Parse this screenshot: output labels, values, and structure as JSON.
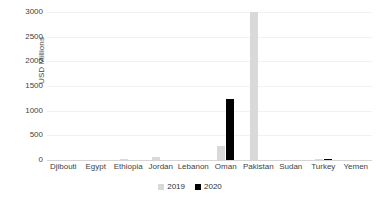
{
  "chart_data": {
    "type": "bar",
    "title": "",
    "xlabel": "",
    "ylabel": "USD Millions",
    "ylim": [
      0,
      3000
    ],
    "yticks": [
      0,
      500,
      1000,
      1500,
      2000,
      2500,
      3000
    ],
    "grid": true,
    "legend_position": "bottom",
    "categories": [
      "Djibouti",
      "Egypt",
      "Ethiopia",
      "Jordan",
      "Lebanon",
      "Oman",
      "Pakistan",
      "Sudan",
      "Turkey",
      "Yemen"
    ],
    "series": [
      {
        "name": "2019",
        "color": "#d9d9d9",
        "values": [
          0,
          0,
          25,
          55,
          0,
          285,
          3000,
          0,
          15,
          0
        ]
      },
      {
        "name": "2020",
        "color": "#000000",
        "values": [
          0,
          0,
          0,
          0,
          0,
          1235,
          0,
          0,
          10,
          0
        ]
      }
    ]
  },
  "axis": {
    "y_title": "USD Millions",
    "y_tick_labels": [
      "0",
      "500",
      "1000",
      "1500",
      "2000",
      "2500",
      "3000"
    ],
    "x_tick_labels": [
      "Djibouti",
      "Egypt",
      "Ethiopia",
      "Jordan",
      "Lebanon",
      "Oman",
      "Pakistan",
      "Sudan",
      "Turkey",
      "Yemen"
    ]
  },
  "legend": {
    "items": [
      {
        "label": "2019"
      },
      {
        "label": "2020"
      }
    ]
  },
  "caption": {
    "text": ""
  }
}
